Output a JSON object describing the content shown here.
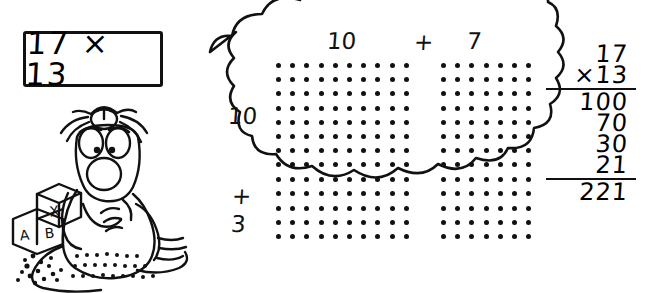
{
  "figure": {
    "title_expression": "17 × 13"
  },
  "problem_box": {
    "expression": "17 × 13"
  },
  "cartoon": {
    "blocks": [
      {
        "letter": "X"
      },
      {
        "letter": "A"
      },
      {
        "letter": "B"
      }
    ],
    "hat": "propeller-beanie"
  },
  "cloud": {
    "column_headers": {
      "first": "10",
      "operator": "+",
      "second": "7"
    },
    "row_headers": {
      "first": "10",
      "operator": "+",
      "second": "3"
    }
  },
  "chart_data": {
    "type": "area-model-dot-array",
    "x_parts": [
      10,
      7
    ],
    "y_parts": [
      10,
      3
    ],
    "x_labels": [
      "10",
      "7"
    ],
    "y_labels": [
      "10",
      "3"
    ],
    "blocks": [
      {
        "name": "top-left",
        "cols": 10,
        "rows": 10,
        "product": 100
      },
      {
        "name": "top-right",
        "cols": 7,
        "rows": 10,
        "product": 70
      },
      {
        "name": "bottom-left",
        "cols": 10,
        "rows": 3,
        "product": 30
      },
      {
        "name": "bottom-right",
        "cols": 7,
        "rows": 3,
        "product": 21
      }
    ],
    "total": 221,
    "dot_color": "#111111",
    "grid": false,
    "legend": "none"
  },
  "long_multiplication": {
    "multiplicand": "17",
    "multiplier": "×13",
    "partials": [
      "100",
      "70",
      "30",
      "21"
    ],
    "answer": "221"
  },
  "colors": {
    "ink": "#111111",
    "paper": "#ffffff"
  }
}
